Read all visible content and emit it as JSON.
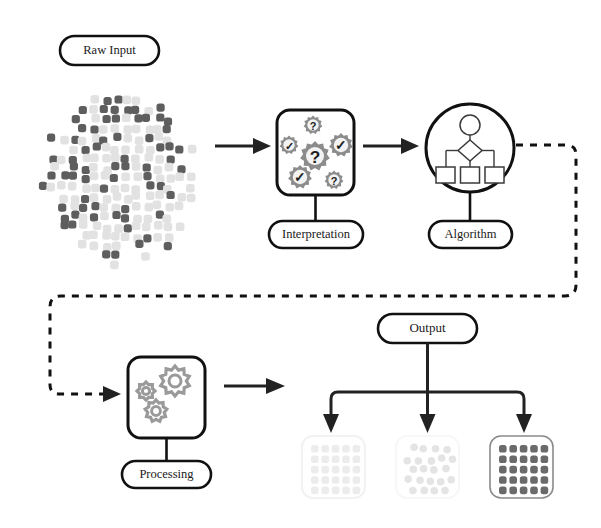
{
  "diagram": {
    "background": "#ffffff"
  },
  "nodes": {
    "raw_input": {
      "label": "Raw Input",
      "shape": "pill"
    },
    "interpretation": {
      "label": "Interpretation",
      "shape": "pill",
      "panel": "rounded-square"
    },
    "algorithm": {
      "label": "Algorithm",
      "shape": "pill",
      "panel": "circle"
    },
    "processing": {
      "label": "Processing",
      "shape": "pill",
      "panel": "rounded-square"
    },
    "output": {
      "label": "Output",
      "shape": "pill"
    }
  },
  "interpretation_badges": [
    {
      "glyph": "?",
      "size": "small",
      "cx": 313,
      "cy": 125,
      "r": 9.5
    },
    {
      "glyph": "✓",
      "size": "small",
      "cx": 289,
      "cy": 145,
      "r": 9.5
    },
    {
      "glyph": "✓",
      "size": "medium",
      "cx": 341,
      "cy": 145,
      "r": 12
    },
    {
      "glyph": "?",
      "size": "large",
      "cx": 315,
      "cy": 156,
      "r": 15
    },
    {
      "glyph": "✓",
      "size": "medium",
      "cx": 300,
      "cy": 177,
      "r": 12
    },
    {
      "glyph": "?",
      "size": "small",
      "cx": 334,
      "cy": 180,
      "r": 9.5
    }
  ],
  "algorithm_flow": {
    "top_shape": "circle",
    "middle_shape": "diamond",
    "bottom_shapes": [
      "square",
      "square",
      "square"
    ]
  },
  "processing_gears": [
    {
      "cx": 175,
      "cy": 381,
      "r": 15,
      "teeth": 10
    },
    {
      "cx": 146,
      "cy": 391,
      "r": 9,
      "teeth": 8
    },
    {
      "cx": 156,
      "cy": 411,
      "r": 11,
      "teeth": 9
    }
  ],
  "connectors": [
    {
      "from": "raw_input_cloud",
      "to": "interpretation",
      "style": "solid-arrow"
    },
    {
      "from": "interpretation",
      "to": "algorithm",
      "style": "solid-arrow"
    },
    {
      "from": "algorithm",
      "to": "processing",
      "style": "dashed-arrow"
    },
    {
      "from": "processing",
      "to": "output_group",
      "style": "solid-arrow"
    },
    {
      "from": "output",
      "to": "result_left",
      "style": "solid-arrow"
    },
    {
      "from": "output",
      "to": "result_middle",
      "style": "solid-arrow"
    },
    {
      "from": "output",
      "to": "result_right",
      "style": "solid-arrow"
    }
  ],
  "colors": {
    "stroke_dark": "#111111",
    "arrow": "#222222",
    "gear_gray": "#8c8c8c",
    "dot_dark": "#5e5e5e",
    "dot_light": "#e2e2e2",
    "result_left_dot": "#ececec",
    "result_middle_dot": "#e4e4e4",
    "result_right_dot": "#6a6a6a",
    "result_right_border": "#8a8a8a"
  },
  "results": [
    {
      "name": "result-left",
      "pattern": "grid",
      "rows": 5,
      "cols": 5,
      "dot_color": "#ececec",
      "border": "#f2f2f2"
    },
    {
      "name": "result-middle",
      "pattern": "scattered",
      "rows": 5,
      "cols": 5,
      "dot_color": "#e4e4e4",
      "border": "#f7f7f7"
    },
    {
      "name": "result-right",
      "pattern": "grid",
      "rows": 5,
      "cols": 5,
      "dot_color": "#6a6a6a",
      "border": "#8a8a8a"
    }
  ],
  "raw_input_cloud": {
    "shape": "scattered-rounded-squares",
    "dark_count": 62,
    "light_count": 104,
    "dark_color": "#5e5e5e",
    "light_color": "#e2e2e2"
  }
}
